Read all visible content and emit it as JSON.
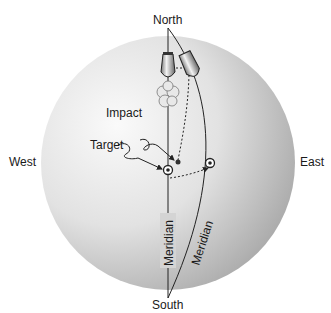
{
  "compass": {
    "north": "North",
    "south": "South",
    "east": "East",
    "west": "West"
  },
  "annotations": {
    "impact": "Impact",
    "target": "Target"
  },
  "meridians": {
    "straight_label": "Meridian",
    "curved_label": "Meridian"
  },
  "colors": {
    "globe_light": "#f4f4f4",
    "globe_dark": "#a8a8a8",
    "line": "#222222"
  }
}
